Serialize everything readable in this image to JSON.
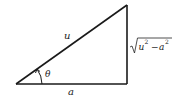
{
  "diagram": {
    "type": "right-triangle",
    "labels": {
      "hypotenuse": "u",
      "adjacent": "a",
      "angle": "θ",
      "opposite_var1": "u",
      "opposite_var2": "a",
      "opposite_exp": "2",
      "opposite_minus": "−"
    },
    "colors": {
      "stroke": "#1a1a1a",
      "text": "#222222"
    }
  }
}
